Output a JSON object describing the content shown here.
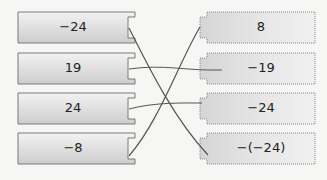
{
  "left_items": [
    {
      "label": "−24"
    },
    {
      "label": "19"
    },
    {
      "label": "24"
    },
    {
      "label": "−8"
    }
  ],
  "right_items": [
    {
      "label": "8"
    },
    {
      "label": "−19"
    },
    {
      "label": "−24"
    },
    {
      "label": "−(−24)"
    }
  ],
  "connections": [
    {
      "from": "−24",
      "to": "−(−24)"
    },
    {
      "from": "19",
      "to": "−19"
    },
    {
      "from": "24",
      "to": "−24"
    },
    {
      "from": "−8",
      "to": "8"
    }
  ],
  "colors": {
    "box_fill_light": "#f0f0f0",
    "box_fill_dark": "#cfcfcf",
    "box_border": "#7a7a7a",
    "line": "#555555"
  }
}
